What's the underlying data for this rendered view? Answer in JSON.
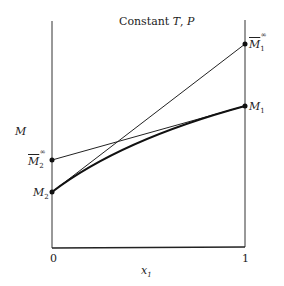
{
  "title": "Constant T, P",
  "title_parts": {
    "prefix": "Constant ",
    "T": "T",
    "sep": ", ",
    "P": "P"
  },
  "y_axis_label": "M",
  "x_axis_label": {
    "var": "x",
    "sub": "1"
  },
  "x_ticks": [
    "0",
    "1"
  ],
  "points": {
    "M1_inf": {
      "base": "M",
      "sub": "1",
      "sup": "∞",
      "overline": true
    },
    "M1": {
      "base": "M",
      "sub": "1"
    },
    "M2_inf": {
      "base": "M",
      "sub": "2",
      "sup": "∞",
      "overline": true
    },
    "M2": {
      "base": "M",
      "sub": "2"
    }
  },
  "colors": {
    "line": "#222222",
    "background": "#ffffff"
  }
}
